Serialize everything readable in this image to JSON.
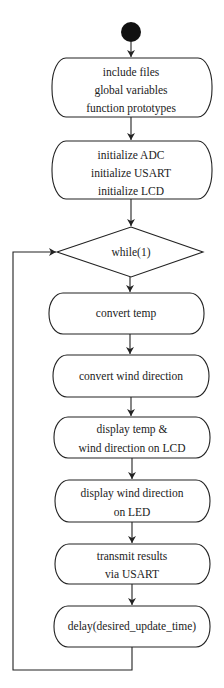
{
  "diagram": {
    "type": "flowchart",
    "start": {
      "shape": "filled-circle",
      "color": "#111111"
    },
    "nodes": [
      {
        "id": "init-includes",
        "shape": "rounded-box",
        "lines": [
          "include files",
          "global variables",
          "function prototypes"
        ]
      },
      {
        "id": "init-peripherals",
        "shape": "rounded-box",
        "lines": [
          "initialize ADC",
          "initialize USART",
          "initialize LCD"
        ]
      },
      {
        "id": "loop",
        "shape": "diamond",
        "lines": [
          "while(1)"
        ]
      },
      {
        "id": "convert-temp",
        "shape": "rounded-box",
        "lines": [
          "convert temp"
        ]
      },
      {
        "id": "convert-wind",
        "shape": "rounded-box",
        "lines": [
          "convert wind direction"
        ]
      },
      {
        "id": "display-lcd",
        "shape": "rounded-box",
        "lines": [
          "display temp &",
          "wind direction on LCD"
        ]
      },
      {
        "id": "display-led",
        "shape": "rounded-box",
        "lines": [
          "display wind direction",
          "on LED"
        ]
      },
      {
        "id": "transmit",
        "shape": "rounded-box",
        "lines": [
          "transmit results",
          "via USART"
        ]
      },
      {
        "id": "delay",
        "shape": "rounded-box",
        "lines": [
          "delay(desired_update_time)"
        ]
      }
    ],
    "edges": [
      [
        "start",
        "init-includes"
      ],
      [
        "init-includes",
        "init-peripherals"
      ],
      [
        "init-peripherals",
        "loop"
      ],
      [
        "loop",
        "convert-temp"
      ],
      [
        "convert-temp",
        "convert-wind"
      ],
      [
        "convert-wind",
        "display-lcd"
      ],
      [
        "display-lcd",
        "display-led"
      ],
      [
        "display-led",
        "transmit"
      ],
      [
        "transmit",
        "delay"
      ],
      [
        "delay",
        "loop"
      ]
    ]
  }
}
